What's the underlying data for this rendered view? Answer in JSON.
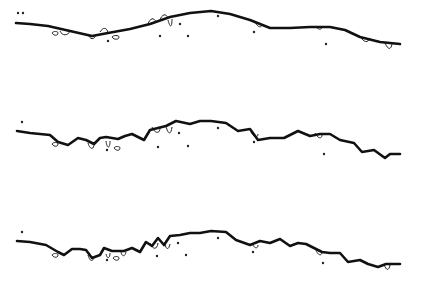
{
  "figure": {
    "background": "#ffffff",
    "stroke_color": "#111111",
    "panels": [
      {
        "id": "profile-smooth",
        "main_path": "M16,23 L30,24 L48,26 L70,31 L92,36 L108,33 L130,29 L150,24 L170,17 L190,13 L211,11 L230,14 L250,20 L270,28 L290,28 L310,27 L330,27 L345,30 L360,37 L380,42 L400,44",
        "thin_paths": [
          "M60,31 C62,36 68,36 70,31",
          "M88,34 C90,40 94,40 96,35",
          "M100,32 C103,27 107,27 108,33",
          "M148,24 C150,18 154,17 156,22",
          "M160,20 C162,14 166,13 168,18",
          "M168,20 C170,28 172,28 172,19",
          "M255,22 C258,28 262,28 262,24",
          "M315,26 C318,30 322,30 322,27",
          "M360,36 C364,43 368,43 370,38",
          "M385,43 C388,50 391,50 392,44",
          "M52,33 C54,36 58,36 58,33 C58,31 53,31 52,33",
          "M112,37 C114,40 119,40 119,37 C119,35 113,35 112,37"
        ],
        "dots": [
          [
            23,
            13
          ],
          [
            160,
            36
          ],
          [
            188,
            36
          ],
          [
            180,
            24
          ],
          [
            218,
            16
          ],
          [
            254,
            32
          ],
          [
            326,
            44
          ],
          [
            108,
            41
          ],
          [
            18,
            13
          ]
        ]
      },
      {
        "id": "profile-medium",
        "main_path": "M17,131 L30,133 L50,135 L58,142 L68,145 L78,138 L86,140 L94,144 L100,138 L106,137 L118,139 L125,136 L132,134 L144,140 L150,130 L158,128 L166,126 L176,121 L190,124 L200,121 L211,121 L226,123 L238,131 L250,129 L258,140 L270,138 L284,138 L298,131 L310,136 L320,134 L330,134 L340,140 L354,143 L362,152 L374,150 L385,158 L390,154 L400,154",
        "thin_paths": [
          "M88,143 C90,150 94,150 94,144",
          "M106,141 C107,149 110,149 110,141",
          "M152,127 C155,134 160,134 160,128",
          "M166,126 C168,135 171,135 172,127",
          "M251,132 C254,138 258,138 258,134",
          "M315,133 C318,139 322,139 322,135",
          "M52,144 C54,147 58,147 58,144 C58,142 53,142 52,144",
          "M114,148 C116,151 120,151 120,148 C120,146 115,146 114,148"
        ],
        "dots": [
          [
            22,
            122
          ],
          [
            158,
            147
          ],
          [
            188,
            146
          ],
          [
            179,
            133
          ],
          [
            218,
            128
          ],
          [
            254,
            142
          ],
          [
            324,
            154
          ],
          [
            107,
            150
          ]
        ]
      },
      {
        "id": "profile-rough",
        "main_path": "M17,241 L30,242 L46,245 L58,252 L64,255 L72,249 L80,249 L86,250 L92,258 L100,255 L104,248 L112,251 L124,251 L132,248 L140,252 L146,242 L152,246 L158,238 L164,245 L170,236 L180,235 L190,233 L200,233 L211,231 L226,232 L236,240 L250,245 L260,241 L270,243 L280,239 L290,246 L298,243 L306,244 L316,249 L322,252 L330,253 L340,253 L348,262 L360,260 L368,264 L378,267 L386,264 L400,264",
        "thin_paths": [
          "M88,255 C90,262 93,262 94,257",
          "M106,254 C107,259 110,259 110,253",
          "M121,252 C122,257 125,257 126,252",
          "M150,243 C153,250 157,250 158,243",
          "M165,244 C166,250 169,250 170,244",
          "M252,243 C254,249 258,249 258,245",
          "M316,250 C318,256 322,256 322,252",
          "M384,264 C386,271 389,271 390,265",
          "M52,255 C54,258 58,258 58,255 C58,253 53,253 52,255",
          "M113,258 C115,261 119,261 119,258 C119,256 114,256 113,258"
        ],
        "dots": [
          [
            22,
            232
          ],
          [
            157,
            256
          ],
          [
            186,
            255
          ],
          [
            178,
            243
          ],
          [
            218,
            238
          ],
          [
            253,
            252
          ],
          [
            323,
            263
          ],
          [
            107,
            260
          ]
        ]
      }
    ]
  }
}
